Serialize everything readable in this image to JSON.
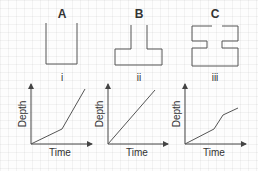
{
  "colors": {
    "line": "#555555",
    "text": "#333333",
    "grid": "#eeeeee"
  },
  "panels": [
    {
      "letter": "A",
      "roman": "i",
      "shape": "46,23 46,64 77,64 77,23",
      "graph": {
        "xlabel": "Time",
        "ylabel": "Depth",
        "points": "31,144 62,129 85,89",
        "chart_like": "piecewise: slow then fast"
      }
    },
    {
      "letter": "B",
      "roman": "ii",
      "shape": "131,25 131,49 115,49 115,65 162,65 162,49 147,49 147,25",
      "graph": {
        "xlabel": "Time",
        "ylabel": "Depth",
        "points": "108,144 155,90",
        "chart_like": "linear"
      }
    },
    {
      "letter": "C",
      "roman": "iii",
      "shape": "212,26 192,26 192,41 207,41 207,48 192,48 192,66 238,66 238,48 222,48 222,41 238,41 238,26 222,26",
      "graph": {
        "xlabel": "Time",
        "ylabel": "Depth",
        "points": "185,144 214,129 223,115 238,108",
        "chart_like": "slow, fast, slow"
      }
    }
  ]
}
